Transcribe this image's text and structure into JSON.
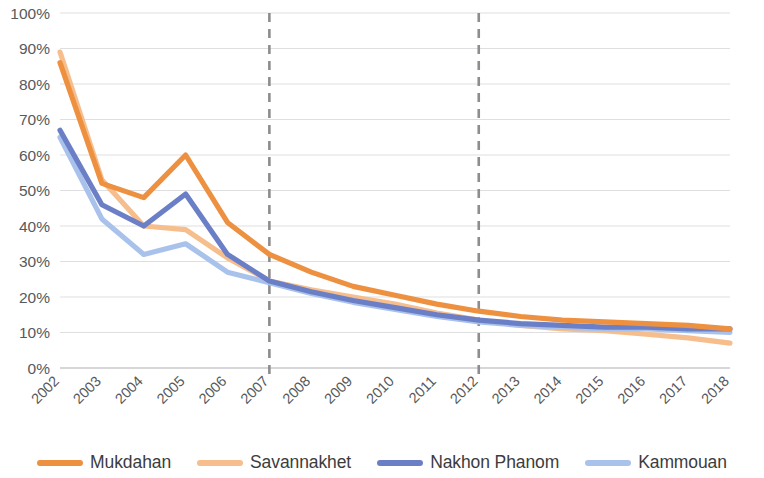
{
  "chart_data": {
    "type": "line",
    "title": "",
    "xlabel": "",
    "ylabel": "",
    "ylim": [
      0,
      100
    ],
    "ytick_labels": [
      "0%",
      "10%",
      "20%",
      "30%",
      "40%",
      "50%",
      "60%",
      "70%",
      "80%",
      "90%",
      "100%"
    ],
    "ytick_values": [
      0,
      10,
      20,
      30,
      40,
      50,
      60,
      70,
      80,
      90,
      100
    ],
    "grid": true,
    "legend_position": "bottom",
    "categories": [
      "2002",
      "2003",
      "2004",
      "2005",
      "2006",
      "2007",
      "2008",
      "2009",
      "2010",
      "2011",
      "2012",
      "2013",
      "2014",
      "2015",
      "2016",
      "2017",
      "2018"
    ],
    "annotations": [
      {
        "name": "divider-2007",
        "type": "vertical-dashed-line",
        "x": "2007",
        "color": "#8d8d8f"
      },
      {
        "name": "divider-2012",
        "type": "vertical-dashed-line",
        "x": "2012",
        "color": "#8d8d8f"
      }
    ],
    "series": [
      {
        "name": "Mukdahan",
        "color": "#ED9141",
        "width": 5.2,
        "values": [
          86,
          52,
          48,
          60,
          41,
          32,
          27,
          23,
          20.5,
          18,
          16,
          14.5,
          13.5,
          13,
          12.5,
          12,
          11
        ]
      },
      {
        "name": "Savannakhet",
        "color": "#F6BE8C",
        "width": 5.2,
        "values": [
          89,
          53,
          40,
          39,
          31,
          24.5,
          22,
          20,
          18,
          15.5,
          13.5,
          12,
          11,
          10.5,
          9.5,
          8.5,
          7
        ]
      },
      {
        "name": "Nakhon Phanom",
        "color": "#6B7FC7",
        "width": 5.2,
        "values": [
          67,
          46,
          40,
          49,
          32,
          24.5,
          21.5,
          19,
          17,
          15,
          13.5,
          12.5,
          12,
          11.5,
          11.5,
          11,
          11
        ]
      },
      {
        "name": "Kammouan",
        "color": "#A8C2EC",
        "width": 5.2,
        "values": [
          65,
          42,
          32,
          35,
          27,
          24,
          21,
          18.5,
          16.5,
          14.5,
          13,
          12,
          11.5,
          11,
          11,
          10.5,
          10
        ]
      }
    ]
  },
  "legend": {
    "items": [
      {
        "label": "Mukdahan",
        "color": "#ED9141"
      },
      {
        "label": "Savannakhet",
        "color": "#F6BE8C"
      },
      {
        "label": "Nakhon Phanom",
        "color": "#6B7FC7"
      },
      {
        "label": "Kammouan",
        "color": "#A8C2EC"
      }
    ]
  }
}
